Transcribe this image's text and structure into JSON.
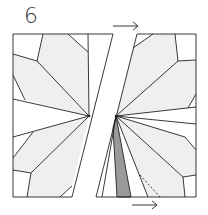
{
  "step_number": "6",
  "colors": {
    "line": "#222222",
    "light_shade": "#efefef",
    "dark_shade": "#9a9a9a",
    "background": "#ffffff"
  },
  "diagram": {
    "arrows": [
      {
        "position": "top",
        "direction": "right"
      },
      {
        "position": "bottom",
        "direction": "right"
      }
    ]
  }
}
